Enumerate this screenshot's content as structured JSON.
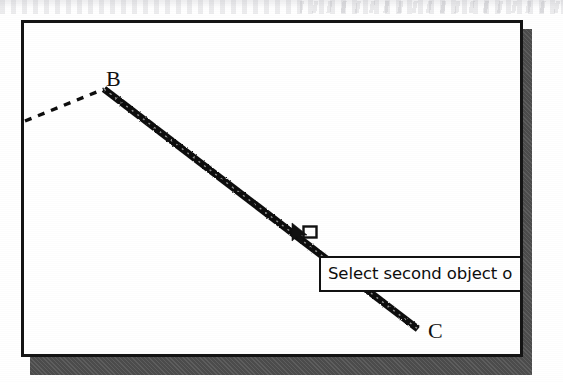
{
  "window": {
    "name": "cad-drawing-window",
    "background_color": "#ffffff",
    "border_color": "#141414",
    "shadow_color": "#4c4c4c"
  },
  "drawing": {
    "labels": [
      {
        "id": "B",
        "text": "B"
      },
      {
        "id": "C",
        "text": "C"
      }
    ],
    "entities": [
      {
        "name": "dashed-line-ab",
        "type": "line",
        "style": "dashed",
        "selected": false,
        "x1": 1,
        "y1": 98,
        "x2": 80,
        "y2": 66
      },
      {
        "name": "selected-line-bc",
        "type": "line",
        "style": "solid-bold",
        "selected": true,
        "x1": 80,
        "y1": 66,
        "x2": 394,
        "y2": 306
      }
    ],
    "line_color": "#111111"
  },
  "cursor": {
    "name": "pickbox-cursor",
    "type": "arrow-with-pickbox",
    "x": 280,
    "y": 212
  },
  "prompt": {
    "text": "Select second object o",
    "full_text_clipped": true,
    "background_color": "#ffffff",
    "border_color": "#111111",
    "text_color": "#0d0d0d"
  },
  "artifact": {
    "description": "scanned page bleed-through strip"
  }
}
